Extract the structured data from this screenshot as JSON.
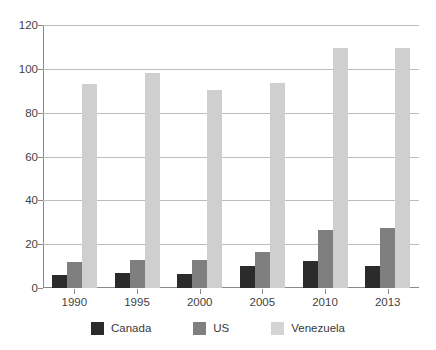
{
  "chart_data": {
    "type": "bar",
    "title": "",
    "subtitle": "",
    "xlabel": "",
    "ylabel": "",
    "categories": [
      "1990",
      "1995",
      "2000",
      "2005",
      "2010",
      "2013"
    ],
    "series": [
      {
        "name": "Canada",
        "color": "#2b2b2b",
        "values": [
          6,
          7,
          6.5,
          10,
          12.5,
          10
        ]
      },
      {
        "name": "US",
        "color": "#7f7f7f",
        "values": [
          12,
          13,
          13,
          16.5,
          26.5,
          27.5
        ]
      },
      {
        "name": "Venezuela",
        "color": "#cfcfcf",
        "values": [
          93,
          98,
          90.5,
          93.5,
          109.5,
          109.5
        ]
      }
    ],
    "ylim": [
      0,
      120
    ],
    "ytick_labels": [
      "0",
      "20",
      "40",
      "60",
      "80",
      "100",
      "120"
    ],
    "ytick_values": [
      0,
      20,
      40,
      60,
      80,
      100,
      120
    ],
    "grid": "horizontal",
    "legend_position": "bottom",
    "legend_entries": [
      {
        "label": "Canada",
        "color": "#2b2b2b"
      },
      {
        "label": "US",
        "color": "#7f7f7f"
      },
      {
        "label": "Venezuela",
        "color": "#d4d4d4"
      }
    ],
    "background_color": "#ffffff",
    "axis_color": "#8a8a8a",
    "gridline_color": "#bdbdbd"
  }
}
